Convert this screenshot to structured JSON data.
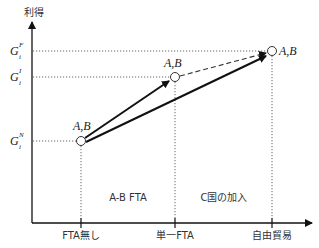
{
  "axes": {
    "y_label": "利得",
    "x_ticks": [
      "FTA無し",
      "単一FTA",
      "自由貿易"
    ]
  },
  "y_levels": [
    {
      "base": "G",
      "sub": "i",
      "sup": "F"
    },
    {
      "base": "G",
      "sub": "i",
      "sup": "I"
    },
    {
      "base": "G",
      "sub": "i",
      "sup": "N"
    }
  ],
  "points": [
    {
      "label": "A,B"
    },
    {
      "label": "A,B"
    },
    {
      "label": "A,B"
    }
  ],
  "regions": [
    "A-B FTA",
    "C国の加入"
  ],
  "colors": {
    "line": "#111111",
    "dotted": "#555555",
    "point_fill": "#ffffff"
  }
}
